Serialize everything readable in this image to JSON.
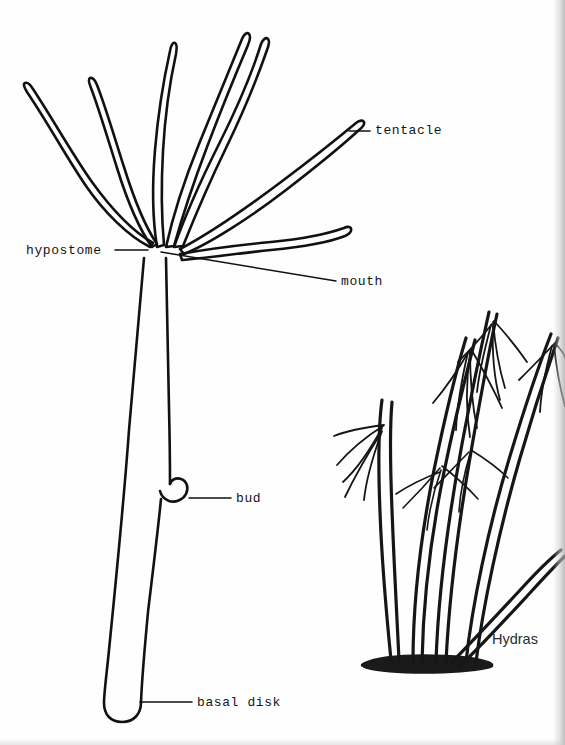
{
  "figure": {
    "kind": "biology-anatomy-diagram",
    "subject": "Hydra",
    "background_color": "#fefefe",
    "ink_color": "#111111"
  },
  "labels": {
    "hypostome": "hypostome",
    "tentacle": "tentacle",
    "mouth": "mouth",
    "bud": "bud",
    "basal_disk": "basal disk",
    "hydras": "Hydras"
  },
  "diagram": {
    "main_hydra": {
      "caption_free": true,
      "parts": [
        "tentacle",
        "hypostome",
        "mouth",
        "bud",
        "basal disk"
      ],
      "tentacle_count": 7
    },
    "hydra_group": {
      "title": "Hydras",
      "individual_count": 5
    }
  },
  "leader_lines": {
    "hypostome": "horizontal line from label right edge to tentacle convergence point",
    "tentacle": "horizontal line from upper-right tentacle tip to label",
    "mouth": "long diagonal line from hypostome down-right to label",
    "bud": "horizontal line from bud protrusion to label",
    "basal_disk": "horizontal line from lower body to label"
  }
}
